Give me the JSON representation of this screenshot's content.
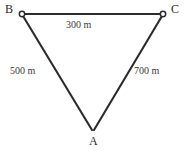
{
  "figure": {
    "type": "geometry-diagram",
    "shape": "triangle",
    "background_color": "#ffffff",
    "stroke_color": "#2b2b2b",
    "text_color": "#2b2b2b"
  },
  "vertices": [
    {
      "id": "B",
      "label": "B",
      "marker": "open-circle",
      "x": 22,
      "y": 14
    },
    {
      "id": "C",
      "label": "C",
      "marker": "open-circle",
      "x": 163,
      "y": 14
    },
    {
      "id": "A",
      "label": "A",
      "marker": "none",
      "x": 93,
      "y": 130
    }
  ],
  "edges": [
    {
      "id": "BC",
      "from": "B",
      "to": "C",
      "label": "300 m",
      "value": 300,
      "unit": "m"
    },
    {
      "id": "AB",
      "from": "B",
      "to": "A",
      "label": "500 m",
      "value": 500,
      "unit": "m"
    },
    {
      "id": "AC",
      "from": "C",
      "to": "A",
      "label": "700 m",
      "value": 700,
      "unit": "m"
    }
  ],
  "labels": {
    "vertex_b": "B",
    "vertex_c": "C",
    "vertex_a": "A",
    "edge_bc": "300 m",
    "edge_ab": "500 m",
    "edge_ac": "700 m"
  }
}
